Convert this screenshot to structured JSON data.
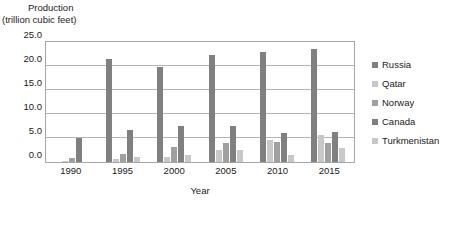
{
  "chart_data": {
    "type": "bar",
    "title": "",
    "ylabel_line1": "Production",
    "ylabel_line2": "(trillion cubic feet)",
    "xlabel": "Year",
    "categories": [
      "1990",
      "1995",
      "2000",
      "2005",
      "2010",
      "2015"
    ],
    "ylim": [
      0.0,
      25.0
    ],
    "yticks": [
      "0.0",
      "5.0",
      "10.0",
      "15.0",
      "20.0",
      "25.0"
    ],
    "ytick_values": [
      0.0,
      5.0,
      10.0,
      15.0,
      20.0,
      25.0
    ],
    "grid": true,
    "legend_position": "right",
    "series": [
      {
        "name": "Russia",
        "color": "#808080",
        "values": [
          0.0,
          21.4,
          19.7,
          22.2,
          22.9,
          23.6
        ]
      },
      {
        "name": "Qatar",
        "color": "#c8c8c8",
        "values": [
          0.3,
          0.6,
          1.1,
          2.4,
          4.5,
          5.7
        ]
      },
      {
        "name": "Norway",
        "color": "#a0a0a0",
        "values": [
          0.9,
          1.7,
          3.2,
          4.0,
          4.1,
          4.0
        ]
      },
      {
        "name": "Canada",
        "color": "#808080",
        "values": [
          4.9,
          6.7,
          7.6,
          7.6,
          6.1,
          6.3
        ]
      },
      {
        "name": "Turkmenistan",
        "color": "#c8c8c8",
        "values": [
          0.0,
          1.0,
          1.5,
          2.4,
          1.4,
          2.9
        ]
      }
    ]
  },
  "legend": {
    "items": [
      {
        "label": "Russia",
        "color": "#808080"
      },
      {
        "label": "Qatar",
        "color": "#c8c8c8"
      },
      {
        "label": "Norway",
        "color": "#a0a0a0"
      },
      {
        "label": "Canada",
        "color": "#808080"
      },
      {
        "label": "Turkmenistan",
        "color": "#c8c8c8"
      }
    ]
  }
}
